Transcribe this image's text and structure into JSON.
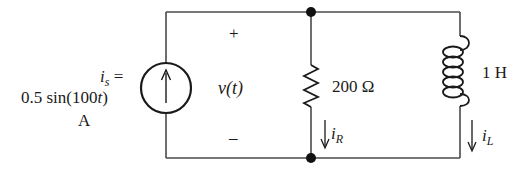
{
  "source": {
    "symbol": "i",
    "subscript": "s",
    "equals": "=",
    "expression_pre": "0.5 sin(100",
    "expression_var": "t",
    "expression_post": ")",
    "unit": "A"
  },
  "voltage": {
    "plus": "+",
    "label_var": "v",
    "label_arg": "(t)",
    "minus": "–"
  },
  "resistor": {
    "value": "200 Ω",
    "current_symbol": "i",
    "current_subscript": "R"
  },
  "inductor": {
    "value": "1 H",
    "current_symbol": "i",
    "current_subscript": "L"
  },
  "colors": {
    "wire": "#4a4a4a",
    "ink": "#1a1a1a",
    "background": "#ffffff"
  }
}
